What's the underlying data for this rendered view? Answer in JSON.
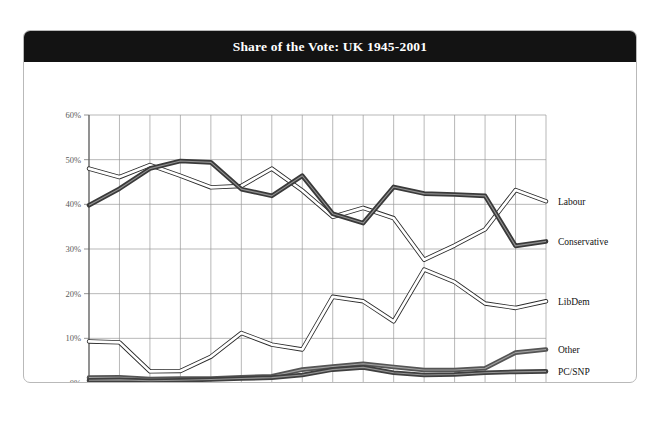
{
  "header": {
    "title": "Share of the Vote: UK 1945-2001"
  },
  "chart_data": {
    "type": "line",
    "title": "Share of the Vote: UK 1945-2001",
    "xlabel": "",
    "ylabel": "",
    "ylim": [
      0,
      60
    ],
    "ytick_labels": [
      "0%",
      "10%",
      "20%",
      "30%",
      "40%",
      "50%",
      "60%"
    ],
    "ytick_values": [
      0,
      10,
      20,
      30,
      40,
      50,
      60
    ],
    "grid": true,
    "legend_position": "right-inline",
    "categories": [
      "1945",
      "1950",
      "1951",
      "1955",
      "1959",
      "1964",
      "1966",
      "1970",
      "1974 Feb",
      "1974 Oct",
      "1979",
      "1983",
      "1987",
      "1992",
      "1997",
      "2001"
    ],
    "category_sublabels": [
      "",
      "",
      "",
      "",
      "",
      "",
      "",
      "",
      "Feb",
      "Oct",
      "",
      "",
      "",
      "",
      "",
      ""
    ],
    "category_main": [
      "1945",
      "1950",
      "1951",
      "1955",
      "1959",
      "1964",
      "1966",
      "1970",
      "1974",
      "1974",
      "1979",
      "1983",
      "1987",
      "1992",
      "1997",
      "2001"
    ],
    "series": [
      {
        "name": "Labour",
        "style": "thin-outline",
        "color": "#2b2b2b",
        "values": [
          48.0,
          46.1,
          48.8,
          46.4,
          43.8,
          44.1,
          48.0,
          43.1,
          37.2,
          39.2,
          36.9,
          27.6,
          30.8,
          34.4,
          43.2,
          40.7
        ]
      },
      {
        "name": "Conservative",
        "style": "thick-dark",
        "color": "#3a3a3a",
        "values": [
          39.8,
          43.5,
          48.0,
          49.7,
          49.4,
          43.4,
          41.9,
          46.4,
          37.9,
          35.8,
          43.9,
          42.4,
          42.2,
          41.9,
          30.7,
          31.7
        ]
      },
      {
        "name": "LibDem",
        "style": "thin-outline",
        "color": "#2b2b2b",
        "values": [
          9.3,
          9.1,
          2.6,
          2.7,
          5.9,
          11.2,
          8.6,
          7.5,
          19.3,
          18.3,
          13.8,
          25.4,
          22.6,
          17.8,
          16.8,
          18.3
        ]
      },
      {
        "name": "Other",
        "style": "thick-dark",
        "color": "#555555",
        "values": [
          1.2,
          1.3,
          0.9,
          1.0,
          1.0,
          1.3,
          1.5,
          3.0,
          3.7,
          4.3,
          3.6,
          2.9,
          2.9,
          3.3,
          6.8,
          7.5
        ]
      },
      {
        "name": "PC/SNP",
        "style": "thick-dark",
        "color": "#3f3f3f",
        "values": [
          0.6,
          0.7,
          0.5,
          0.6,
          0.8,
          1.0,
          1.2,
          1.8,
          3.0,
          3.5,
          2.3,
          1.8,
          1.9,
          2.3,
          2.5,
          2.6
        ]
      }
    ],
    "series_label_positions": [
      {
        "name": "Labour",
        "value": 40.7
      },
      {
        "name": "Conservative",
        "value": 31.7
      },
      {
        "name": "LibDem",
        "value": 18.3
      },
      {
        "name": "Other",
        "value": 7.5
      },
      {
        "name": "PC/SNP",
        "value": 2.6
      }
    ]
  }
}
